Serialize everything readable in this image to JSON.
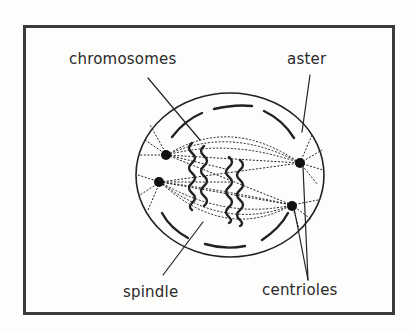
{
  "figure": {
    "labels": {
      "chromosomes": "chromosomes",
      "aster": "aster",
      "spindle": "spindle",
      "centrioles": "centrioles"
    }
  }
}
